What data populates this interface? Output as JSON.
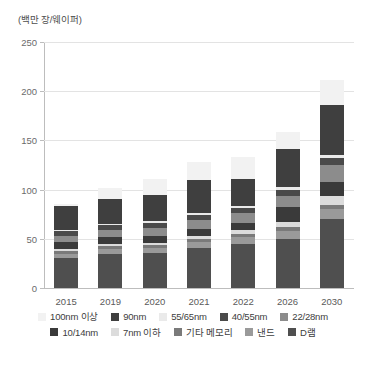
{
  "axis_unit_caption": "(백만 장/웨이퍼)",
  "legend": {
    "rows": [
      [
        {
          "label": "100nm 이상",
          "color": "#f2f2f2"
        },
        {
          "label": "90nm",
          "color": "#3f3f3f"
        },
        {
          "label": "55/65nm",
          "color": "#eaeaea"
        },
        {
          "label": "40/55nm",
          "color": "#4a4a4a"
        },
        {
          "label": "22/28nm",
          "color": "#8c8c8c"
        }
      ],
      [
        {
          "label": "10/14nm",
          "color": "#3a3a3a"
        },
        {
          "label": "7nm 이하",
          "color": "#dcdcdc"
        },
        {
          "label": "기타 메모리",
          "color": "#7a7a7a"
        },
        {
          "label": "낸드",
          "color": "#9a9a9a"
        },
        {
          "label": "D램",
          "color": "#4f4f4f"
        }
      ]
    ]
  },
  "chart_data": {
    "type": "bar",
    "title": "",
    "subtitle": "",
    "xlabel": "",
    "ylabel": "(백만 장/웨이퍼)",
    "ylim": [
      0,
      250
    ],
    "yticks": [
      0,
      50,
      100,
      150,
      200,
      250
    ],
    "ytick_labels": [
      "0",
      "50",
      "100",
      "150",
      "200",
      "250"
    ],
    "grid": true,
    "stacked": true,
    "legend_position": "bottom",
    "categories": [
      "2015",
      "2019",
      "2020",
      "2021",
      "2022",
      "2026",
      "2030"
    ],
    "series": [
      {
        "name": "D램",
        "color": "#4f4f4f",
        "values": [
          30,
          35,
          36,
          41,
          45,
          50,
          70
        ]
      },
      {
        "name": "낸드",
        "color": "#9a9a9a",
        "values": [
          5,
          5,
          5,
          6,
          7,
          8,
          10
        ]
      },
      {
        "name": "기타 메모리",
        "color": "#7a7a7a",
        "values": [
          3,
          3,
          3,
          3,
          3,
          4,
          4
        ]
      },
      {
        "name": "7nm 이하",
        "color": "#dcdcdc",
        "values": [
          2,
          2,
          2,
          3,
          4,
          5,
          10
        ]
      },
      {
        "name": "10/14nm",
        "color": "#3a3a3a",
        "values": [
          7,
          7,
          7,
          7,
          7,
          15,
          14
        ]
      },
      {
        "name": "22/28nm",
        "color": "#8c8c8c",
        "values": [
          6,
          7,
          8,
          9,
          10,
          12,
          17
        ]
      },
      {
        "name": "40/55nm",
        "color": "#4a4a4a",
        "values": [
          5,
          5,
          5,
          5,
          5,
          6,
          7
        ]
      },
      {
        "name": "55/65nm",
        "color": "#eaeaea",
        "values": [
          1,
          1,
          2,
          2,
          2,
          3,
          3
        ]
      },
      {
        "name": "90nm",
        "color": "#3f3f3f",
        "values": [
          24,
          26,
          27,
          34,
          28,
          38,
          51
        ]
      },
      {
        "name": "100nm 이상",
        "color": "#f2f2f2",
        "values": [
          3,
          11,
          16,
          18,
          22,
          18,
          25
        ]
      }
    ],
    "totals": [
      86,
      102,
      111,
      128,
      133,
      159,
      211
    ]
  }
}
